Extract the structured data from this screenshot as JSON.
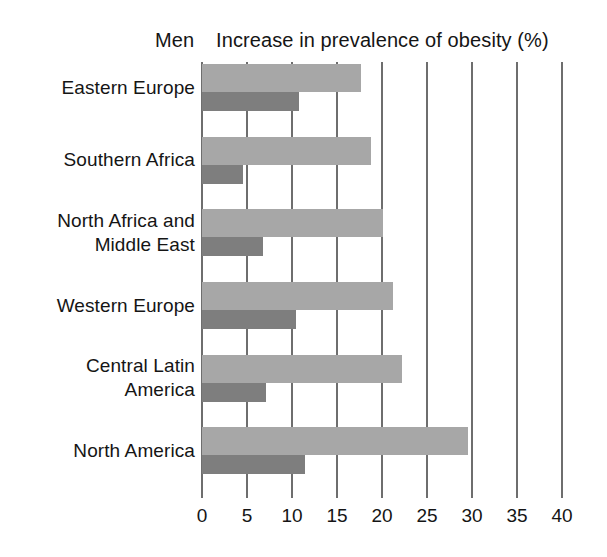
{
  "header": {
    "group_label": "Men",
    "title": "Increase in prevalence of obesity (%)"
  },
  "axis": {
    "tick_labels": [
      "0",
      "5",
      "10",
      "15",
      "20",
      "25",
      "30",
      "35",
      "40"
    ]
  },
  "colors": {
    "bar_light": "#a7a7a7",
    "bar_dark": "#7e7e7e",
    "gridline": "#6e6e6e",
    "text": "#151515",
    "background": "#ffffff"
  },
  "categories": [
    "Eastern Europe",
    "Southern Africa",
    "North Africa and\nMiddle East",
    "Western Europe",
    "Central Latin\nAmerica",
    "North America"
  ],
  "chart_data": {
    "type": "bar",
    "orientation": "horizontal",
    "title": "Increase in prevalence of obesity (%)",
    "subtitle": "Men",
    "xlabel": "",
    "ylabel": "",
    "xlim": [
      0,
      40
    ],
    "xticks": [
      0,
      5,
      10,
      15,
      20,
      25,
      30,
      35,
      40
    ],
    "grid": "vertical",
    "legend": "none",
    "categories": [
      "Eastern Europe",
      "Southern Africa",
      "North Africa and Middle East",
      "Western Europe",
      "Central Latin America",
      "North America"
    ],
    "series": [
      {
        "name": "light-bar",
        "color": "#a7a7a7",
        "values": [
          17.7,
          18.8,
          20.1,
          21.2,
          22.2,
          29.6
        ]
      },
      {
        "name": "dark-bar",
        "color": "#7e7e7e",
        "values": [
          10.8,
          4.5,
          6.8,
          10.4,
          7.1,
          11.4
        ]
      }
    ]
  }
}
